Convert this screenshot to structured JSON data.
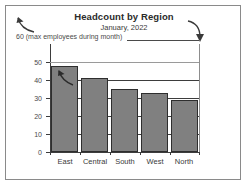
{
  "chart_data": {
    "type": "bar",
    "title": "Headcount by Region",
    "subtitle": "January, 2022",
    "categories": [
      "East",
      "Central",
      "South",
      "West",
      "North"
    ],
    "values": [
      48,
      41,
      35,
      33,
      29
    ],
    "series": [
      {
        "name": "Headcount",
        "values": [
          48,
          41,
          35,
          33,
          29
        ]
      }
    ],
    "xlabel": "",
    "ylabel": "",
    "ylim": [
      0,
      60
    ],
    "ytick_labels": [
      "0",
      "10",
      "20",
      "30",
      "40",
      "50"
    ],
    "ytick_values": [
      0,
      10,
      20,
      30,
      40,
      50
    ],
    "grid": true,
    "legend": false,
    "bar_color": "#808080",
    "bar_border_color": "#2e2e2e",
    "annotations": {
      "max_label": "60 (max employees during month)",
      "max_value": 60,
      "arrow_top_left": "curved-arrow-up-left",
      "arrow_top_right": "curved-arrow-down",
      "arrow_in_bar": "curved-arrow-up-left"
    }
  }
}
